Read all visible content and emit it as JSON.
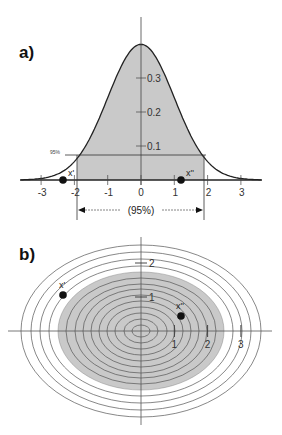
{
  "panels": {
    "a": {
      "label": "a)",
      "x_ticks": [
        "-3",
        "-2",
        "-1",
        "0",
        "1",
        "2",
        "3"
      ],
      "y_ticks": [
        "0.1",
        "0.2",
        "0.3"
      ],
      "level_label": "95%",
      "interval_label": "(95%)",
      "point_left_label": "x'",
      "point_right_label": "x''"
    },
    "b": {
      "label": "b)",
      "x_ticks": [
        "1",
        "2",
        "3"
      ],
      "y_ticks": [
        "1",
        "2"
      ],
      "point_left_label": "x'",
      "point_right_label": "x''"
    }
  },
  "colors": {
    "shade": "#c8c8c8",
    "line": "#222222",
    "ring": "#666666"
  },
  "chart_data": [
    {
      "type": "area",
      "title": "a) Univariate standard normal density with 95% interval",
      "xlabel": "",
      "ylabel": "",
      "xlim": [
        -3.5,
        3.5
      ],
      "ylim": [
        0,
        0.4
      ],
      "x_ticks": [
        -3,
        -2,
        -1,
        0,
        1,
        2,
        3
      ],
      "y_ticks": [
        0.1,
        0.2,
        0.3
      ],
      "shaded_interval": [
        -1.96,
        1.96
      ],
      "shaded_label": "(95%)",
      "level_line": {
        "label": "95%",
        "y": 0.074
      },
      "points": [
        {
          "label": "x'",
          "x": -2.35,
          "y": 0
        },
        {
          "label": "x''",
          "x": 1.2,
          "y": 0
        }
      ],
      "grid": false
    },
    {
      "type": "contour",
      "title": "b) Bivariate normal contour ellipses with 95% region",
      "x_ticks": [
        1,
        2,
        3
      ],
      "y_ticks": [
        1,
        2
      ],
      "shaded_region": "95% ellipse",
      "points": [
        {
          "label": "x'",
          "x": -2.35,
          "y": 1.0
        },
        {
          "label": "x''",
          "x": 1.2,
          "y": 0.45
        }
      ],
      "grid": false
    }
  ]
}
